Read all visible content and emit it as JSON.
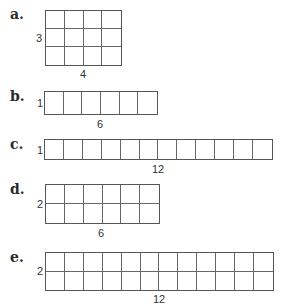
{
  "items": [
    {
      "letter": "a.",
      "rows": 3,
      "cols": 4,
      "row_label": "3",
      "col_label": "4",
      "letter_pos": [
        10,
        6
      ],
      "grid": {
        "x": 45,
        "y": 10,
        "w": 77,
        "h": 56
      },
      "row_label_pos": [
        36,
        33
      ],
      "col_label_pos": [
        83,
        69
      ]
    },
    {
      "letter": "b.",
      "rows": 1,
      "cols": 6,
      "row_label": "1",
      "col_label": "6",
      "letter_pos": [
        10,
        88
      ],
      "grid": {
        "x": 44,
        "y": 91,
        "w": 114,
        "h": 24
      },
      "row_label_pos": [
        37,
        98
      ],
      "col_label_pos": [
        100,
        119
      ]
    },
    {
      "letter": "c.",
      "rows": 1,
      "cols": 12,
      "row_label": "1",
      "col_label": "12",
      "letter_pos": [
        10,
        136
      ],
      "grid": {
        "x": 44,
        "y": 139,
        "w": 229,
        "h": 21
      },
      "row_label_pos": [
        37,
        145
      ],
      "col_label_pos": [
        158,
        164
      ]
    },
    {
      "letter": "d.",
      "rows": 2,
      "cols": 6,
      "row_label": "2",
      "col_label": "6",
      "letter_pos": [
        10,
        181
      ],
      "grid": {
        "x": 45,
        "y": 184,
        "w": 115,
        "h": 40
      },
      "row_label_pos": [
        37,
        199
      ],
      "col_label_pos": [
        101,
        228
      ]
    },
    {
      "letter": "e.",
      "rows": 2,
      "cols": 12,
      "row_label": "2",
      "col_label": "12",
      "letter_pos": [
        10,
        249
      ],
      "grid": {
        "x": 45,
        "y": 252,
        "w": 229,
        "h": 39
      },
      "row_label_pos": [
        37,
        266
      ],
      "col_label_pos": [
        159,
        294
      ]
    }
  ]
}
